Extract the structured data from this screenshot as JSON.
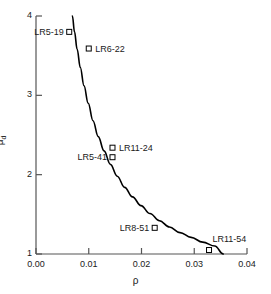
{
  "chart_data": {
    "type": "scatter",
    "title": "",
    "xlabel": "ρ",
    "ylabel": "μ",
    "ylabel_sub": "d",
    "xlim": [
      0.0,
      0.04
    ],
    "ylim": [
      1,
      4
    ],
    "grid": false,
    "legend": "none",
    "xticks": [
      0.0,
      0.01,
      0.02,
      0.03,
      0.04
    ],
    "xtick_labels": [
      "0.00",
      "0.01",
      "0.02",
      "0.03",
      "0.04"
    ],
    "yticks": [
      1,
      2,
      3,
      4
    ],
    "ytick_labels": [
      "1",
      "2",
      "3",
      "4"
    ],
    "marker": "open-square",
    "points": [
      {
        "label": "LR5-19",
        "x": 0.0063,
        "y": 3.8,
        "label_side": "left"
      },
      {
        "label": "LR6-22",
        "x": 0.01,
        "y": 3.59,
        "label_side": "right"
      },
      {
        "label": "LR11-24",
        "x": 0.0145,
        "y": 2.34,
        "label_side": "right"
      },
      {
        "label": "LR5-41",
        "x": 0.0145,
        "y": 2.22,
        "label_side": "left"
      },
      {
        "label": "LR8-51",
        "x": 0.0225,
        "y": 1.33,
        "label_side": "left"
      },
      {
        "label": "LR11-54",
        "x": 0.0328,
        "y": 1.05,
        "label_side": "above-right"
      }
    ],
    "curve": {
      "name": "fitted-curve",
      "description": "monotonically decreasing hyperbolic fit",
      "points": [
        [
          0.0069,
          4.0
        ],
        [
          0.0073,
          3.8
        ],
        [
          0.0078,
          3.58
        ],
        [
          0.0084,
          3.35
        ],
        [
          0.0091,
          3.12
        ],
        [
          0.0099,
          2.9
        ],
        [
          0.0108,
          2.68
        ],
        [
          0.0118,
          2.48
        ],
        [
          0.0129,
          2.3
        ],
        [
          0.0141,
          2.13
        ],
        [
          0.0154,
          1.98
        ],
        [
          0.0168,
          1.84
        ],
        [
          0.0183,
          1.72
        ],
        [
          0.0199,
          1.61
        ],
        [
          0.0216,
          1.51
        ],
        [
          0.0234,
          1.42
        ],
        [
          0.0253,
          1.34
        ],
        [
          0.0273,
          1.27
        ],
        [
          0.0294,
          1.21
        ],
        [
          0.0316,
          1.15
        ],
        [
          0.0339,
          1.1
        ],
        [
          0.0355,
          1.0
        ]
      ]
    },
    "axis_color": "#3a3a3a",
    "curve_color": "#000000",
    "marker_color": "#000000",
    "text_color": "#1a1a1a"
  }
}
